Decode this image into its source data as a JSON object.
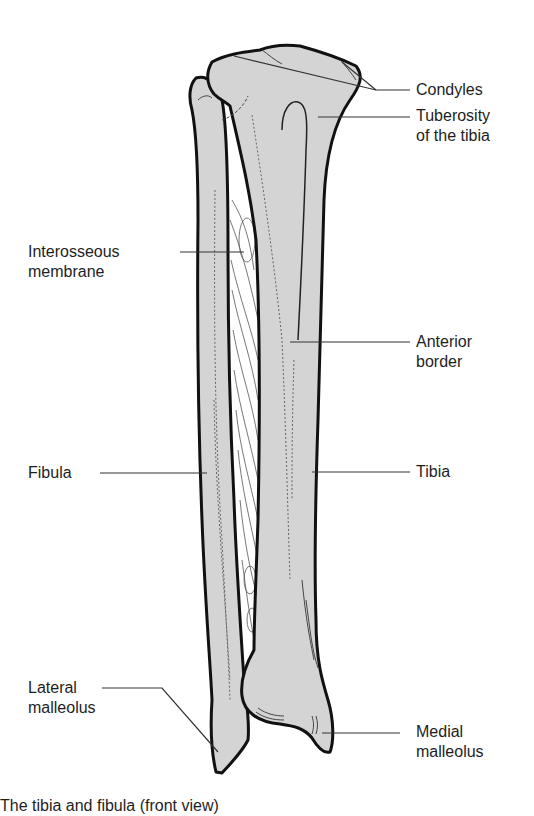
{
  "figure": {
    "title": "The tibia and fibula (front view)",
    "colors": {
      "bone_fill": "#d4d4d4",
      "outline": "#111111",
      "leader_line": "#333333",
      "membrane_lines": "#555555",
      "background": "#ffffff"
    }
  },
  "labels": {
    "condyles": "Condyles",
    "tuberosity_line1": "Tuberosity",
    "tuberosity_line2": "of the tibia",
    "interosseous_line1": "Interosseous",
    "interosseous_line2": "membrane",
    "anterior_line1": "Anterior",
    "anterior_line2": "border",
    "fibula": "Fibula",
    "tibia": "Tibia",
    "lateral_line1": "Lateral",
    "lateral_line2": "malleolus",
    "medial_line1": "Medial",
    "medial_line2": "malleolus"
  },
  "caption": "The tibia and fibula (front view)"
}
